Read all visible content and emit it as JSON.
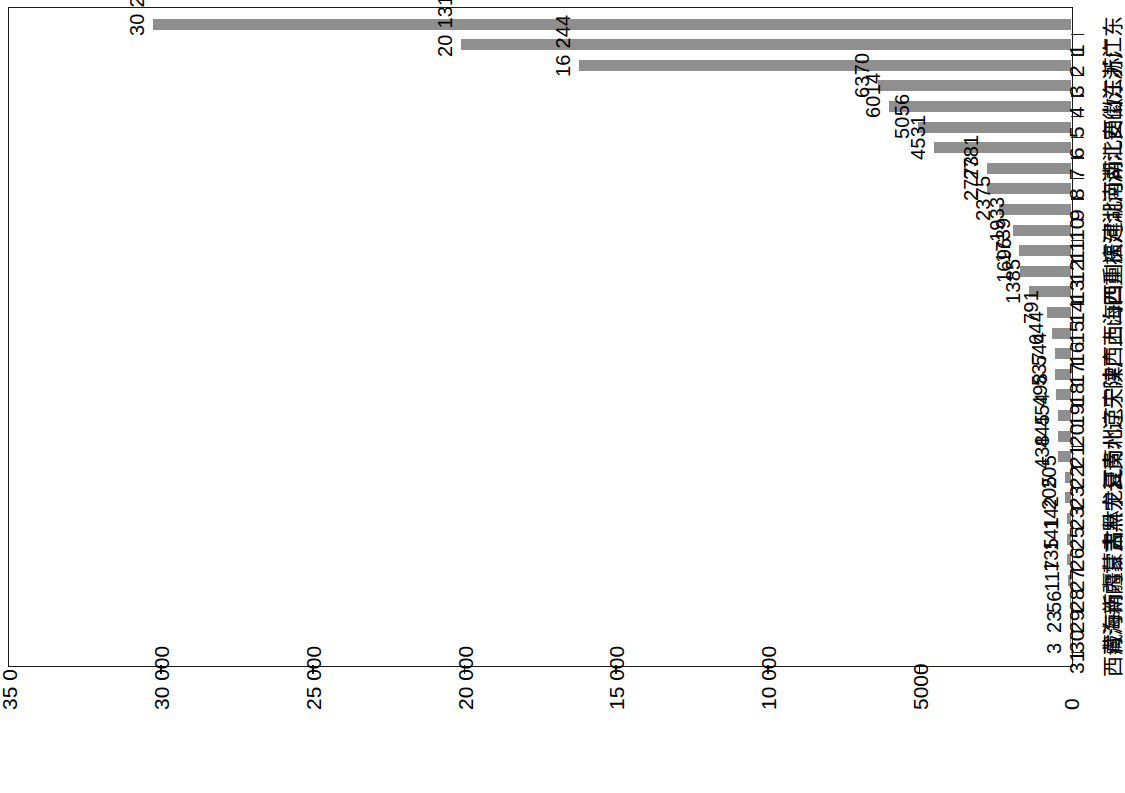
{
  "chart_data": {
    "type": "bar",
    "title": "",
    "subtitle": "",
    "xlabel": "",
    "ylabel": "",
    "orientation": "rotated-90-ccw",
    "grid": false,
    "legend": "none",
    "bar_color": "#8f8f8f",
    "axis_color": "#1a1a1a",
    "value_axis": {
      "min": 0,
      "max": 35000,
      "tick_values": [
        0,
        5000,
        10000,
        15000,
        20000,
        25000,
        30000,
        35000
      ],
      "tick_labels": [
        "0",
        "5000",
        "10 000",
        "15 000",
        "20 000",
        "25 000",
        "30 000",
        "35 0"
      ],
      "thousands_separator": "space"
    },
    "categories": [
      "广东",
      "浙江",
      "江苏",
      "山东",
      "安徽",
      "江西",
      "湖北",
      "河南",
      "湖南",
      "河北",
      "福建",
      "重庆",
      "四川",
      "山西",
      "上海",
      "广西",
      "陕西",
      "天津",
      "辽宁",
      "北京",
      "贵州",
      "云南",
      "宁夏",
      "黑龙江",
      "吉林",
      "甘肃",
      "内蒙古",
      "新疆",
      "海南",
      "青海",
      "西藏"
    ],
    "ranks": [
      "1",
      "2",
      "3",
      "4",
      "5",
      "6",
      "7",
      "8",
      "9",
      "10",
      "11",
      "12",
      "13",
      "14",
      "15",
      "16",
      "17",
      "18",
      "19",
      "20",
      "21",
      "22",
      "23",
      "23",
      "25",
      "26",
      "27",
      "28",
      "29",
      "30",
      "31"
    ],
    "values": [
      30261,
      20131,
      16244,
      6370,
      6014,
      5056,
      4531,
      2781,
      2773,
      2375,
      1933,
      1739,
      1696,
      1385,
      791,
      644,
      544,
      537,
      498,
      454,
      445,
      438,
      205,
      205,
      142,
      141,
      135,
      117,
      56,
      23,
      3
    ],
    "value_labels": [
      "30 261",
      "20 131",
      "16 244",
      "6370",
      "6014",
      "5056",
      "4531",
      "2781",
      "2773",
      "2375",
      "1933",
      "1739",
      "1696",
      "1385",
      "791",
      "644",
      "544",
      "537",
      "498",
      "454",
      "445",
      "438",
      "205",
      "205",
      "142",
      "141",
      "135",
      "117",
      "56",
      "23",
      "3"
    ]
  }
}
